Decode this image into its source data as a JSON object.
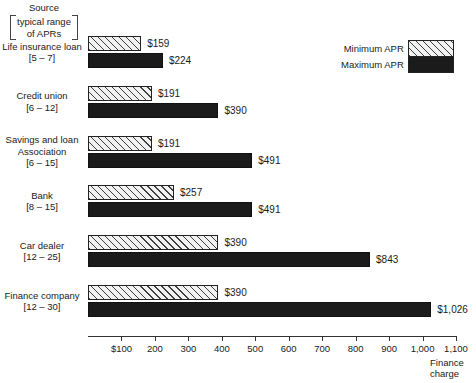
{
  "source_header": {
    "title": "Source",
    "bracket_line1": "typical range",
    "bracket_line2": "of APRs"
  },
  "legend": {
    "min_label": "Minimum APR",
    "max_label": "Maximum APR"
  },
  "axis": {
    "title_line1": "Finance",
    "title_line2": "charge"
  },
  "chart_data": {
    "type": "bar",
    "orientation": "horizontal",
    "title": "",
    "xlabel": "Finance charge",
    "ylabel": "Source [typical range of APRs]",
    "xlim": [
      0,
      1100
    ],
    "grid": false,
    "legend_position": "top-right",
    "categories": [
      "Life insurance loan",
      "Credit union",
      "Savings and loan Association",
      "Bank",
      "Car dealer",
      "Finance company"
    ],
    "category_lines": [
      [
        "Life insurance loan",
        "[5 – 7]"
      ],
      [
        "Credit union",
        "[6 – 12]"
      ],
      [
        "Savings and loan",
        "Association",
        "[6 – 15]"
      ],
      [
        "Bank",
        "[8 – 15]"
      ],
      [
        "Car dealer",
        "[12 – 25]"
      ],
      [
        "Finance company",
        "[12 – 30]"
      ]
    ],
    "apr_ranges": [
      "[5 – 7]",
      "[6 – 12]",
      "[6 – 15]",
      "[8 – 15]",
      "[12 – 25]",
      "[12 – 30]"
    ],
    "series": [
      {
        "name": "Minimum APR",
        "values": [
          159,
          191,
          191,
          257,
          390,
          390
        ],
        "labels": [
          "$159",
          "$191",
          "$191",
          "$257",
          "$390",
          "$390"
        ]
      },
      {
        "name": "Maximum APR",
        "values": [
          224,
          390,
          491,
          491,
          843,
          1026
        ],
        "labels": [
          "$224",
          "$390",
          "$491",
          "$491",
          "$843",
          "$1,026"
        ]
      }
    ],
    "tick_values": [
      100,
      200,
      300,
      400,
      500,
      600,
      700,
      800,
      900,
      1000,
      1100
    ],
    "tick_labels": [
      "$100",
      "200",
      "300",
      "400",
      "500",
      "600",
      "700",
      "800",
      "900",
      "1,000",
      "1,100"
    ]
  }
}
